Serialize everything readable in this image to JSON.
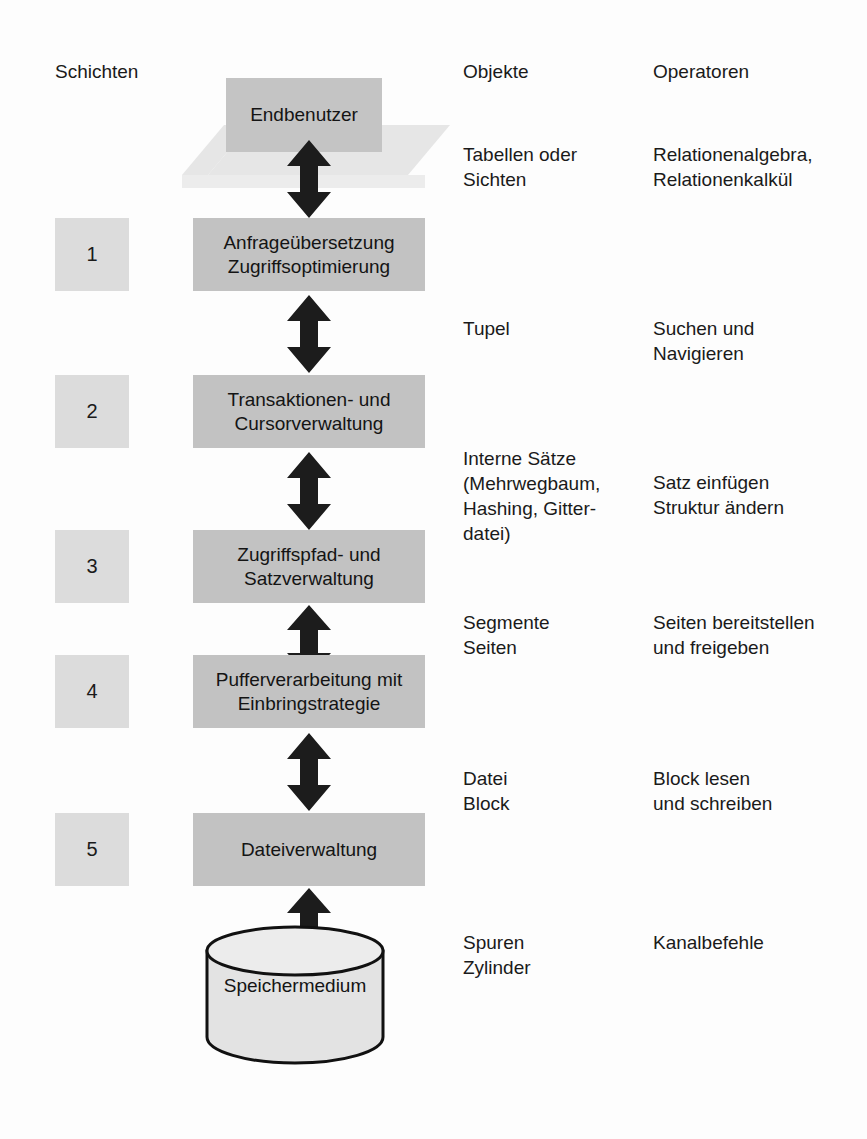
{
  "diagram": {
    "headers": {
      "layers": "Schichten",
      "objects": "Objekte",
      "operators": "Operatoren"
    },
    "top_node": {
      "label": "Endbenutzer",
      "shape": "plate"
    },
    "bottom_node": {
      "label": "Speichermedium",
      "shape": "cylinder"
    },
    "layers": [
      {
        "number": "1",
        "title": "Anfrageübersetzung\nZugriffsoptimierung"
      },
      {
        "number": "2",
        "title": "Transaktionen- und\nCursorverwaltung"
      },
      {
        "number": "3",
        "title": "Zugriffspfad- und\nSatzverwaltung"
      },
      {
        "number": "4",
        "title": "Pufferverarbeitung mit\nEinbringstrategie"
      },
      {
        "number": "5",
        "title": "Dateiverwaltung"
      }
    ],
    "interfaces": [
      {
        "objects": "Tabellen oder\nSichten",
        "operators": "Relationenalgebra,\nRelationenkalkül"
      },
      {
        "objects": "Tupel",
        "operators": "Suchen und\nNavigieren"
      },
      {
        "objects": "Interne Sätze\n(Mehrwegbaum,\nHashing, Gitter-\ndatei)",
        "operators": "Satz einfügen\nStruktur ändern"
      },
      {
        "objects": "Segmente\nSeiten",
        "operators": "Seiten bereitstellen\nund freigeben"
      },
      {
        "objects": "Datei\nBlock",
        "operators": "Block lesen\nund schreiben"
      },
      {
        "objects": "Spuren\nZylinder",
        "operators": "Kanalbefehle"
      }
    ],
    "colors": {
      "layer_box": "#c2c2c2",
      "number_chip": "#dcdcdc",
      "plate": "#e6e6e6",
      "arrow": "#1c1c1c",
      "cylinder_fill": "#e3e3e3",
      "cylinder_stroke": "#111111",
      "background": "#fdfdfd"
    }
  }
}
